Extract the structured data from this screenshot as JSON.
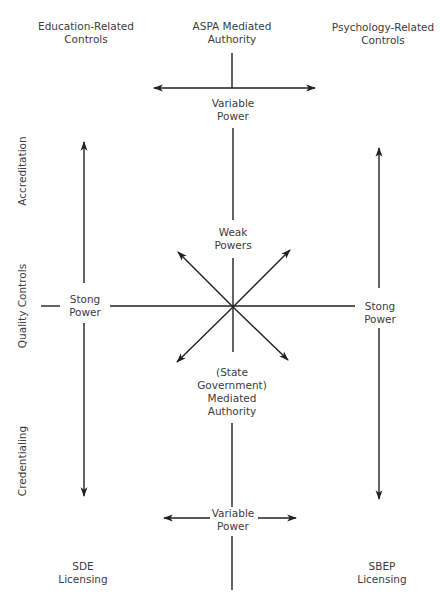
{
  "diagram": {
    "headers": {
      "education": [
        "Education-Related",
        "Controls"
      ],
      "aspa": [
        "ASPA Mediated",
        "Authority"
      ],
      "psychology": [
        "Psychology-Related",
        "Controls"
      ]
    },
    "side_labels": {
      "accreditation": "Accreditation",
      "quality_controls": "Quality Controls",
      "credentialing": "Credentialing"
    },
    "nodes": {
      "variable_power_top": [
        "Variable",
        "Power"
      ],
      "weak_powers": [
        "Weak",
        "Powers"
      ],
      "strong_power_left": [
        "Stong",
        "Power"
      ],
      "strong_power_right": [
        "Stong",
        "Power"
      ],
      "state_authority": [
        "(State",
        "Government)",
        "Mediated",
        "Authority"
      ],
      "variable_power_bottom": [
        "Variable",
        "Power"
      ]
    },
    "footers": {
      "sde": [
        "SDE",
        "Licensing"
      ],
      "sbep": [
        "SBEP",
        "Licensing"
      ]
    },
    "colors": {
      "line": "#222222",
      "text": "#3d3d3d",
      "background": "#ffffff"
    }
  }
}
